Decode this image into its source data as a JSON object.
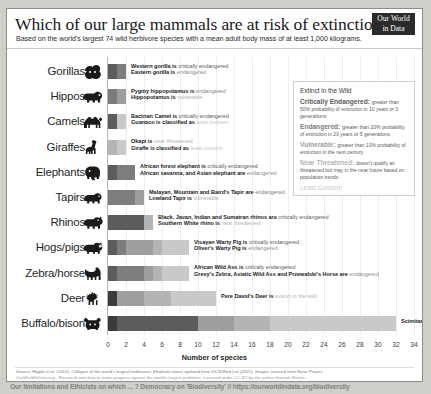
{
  "header": {
    "title": "Which of our large mammals are at risk of extinction?",
    "subtitle": "Based on the world's largest 74 wild herbivore species with a mean adult body mass of at least 1,000 kilograms.",
    "logo_line1": "Our World",
    "logo_line2": "in Data"
  },
  "legend": {
    "title": "IUCN Red List categories",
    "items": [
      {
        "name": "Extinct in the Wild",
        "desc": "",
        "color": "#3b3b3b"
      },
      {
        "name": "Critically Endangered:",
        "desc": "greater than 50% probability of extinction in 10 years or 3 generations",
        "color": "#5c5c5c"
      },
      {
        "name": "Endangered:",
        "desc": "greater than 20% probability of extinction in 20 years or 5 generations",
        "color": "#7d7d7d"
      },
      {
        "name": "Vulnerable:",
        "desc": "greater than 10% probability of extinction in the next century",
        "color": "#9e9e9e"
      },
      {
        "name": "Near Threatened:",
        "desc": "doesn't qualify as threatened but may in the near future based on population trends",
        "color": "#b4b4b4"
      },
      {
        "name": "Least Concern",
        "desc": "",
        "color": "#c9c9c9"
      }
    ]
  },
  "chart_data": {
    "type": "bar",
    "title": "Which of our large mammals are at risk of extinction?",
    "subtitle": "Based on the world's largest 74 wild herbivore species with a mean adult body mass of at least 1,000 kilograms.",
    "xlabel": "Number of species",
    "ylabel": "",
    "xlim": [
      0,
      34
    ],
    "grid": true,
    "legend_position": "top-right",
    "stacked": true,
    "xticks": [
      0,
      2,
      4,
      6,
      8,
      10,
      12,
      14,
      16,
      18,
      20,
      22,
      24,
      26,
      28,
      30,
      32,
      34
    ],
    "series": [
      {
        "name": "Extinct in the Wild",
        "color": "#3b3b3b"
      },
      {
        "name": "Critically Endangered",
        "color": "#5c5c5c"
      },
      {
        "name": "Endangered",
        "color": "#7d7d7d"
      },
      {
        "name": "Vulnerable",
        "color": "#9e9e9e"
      },
      {
        "name": "Near Threatened",
        "color": "#b4b4b4"
      },
      {
        "name": "Least Concern",
        "color": "#c9c9c9"
      }
    ],
    "categories": [
      "Gorillas",
      "Hippos",
      "Camels",
      "Giraffes",
      "Elephants",
      "Tapirs",
      "Rhinos",
      "Hogs/pigs",
      "Zebra/horse",
      "Deer",
      "Buffalo/bison"
    ],
    "rows": [
      {
        "label": "Gorillas",
        "icon": "gorilla-icon",
        "total": 2,
        "segments": [
          {
            "cat": "Critically Endangered",
            "value": 1
          },
          {
            "cat": "Endangered",
            "value": 1
          }
        ],
        "annotations": [
          {
            "species": "Western gorilla is",
            "status": " critically endangered",
            "status_color": "#5c5c5c"
          },
          {
            "species": "Eastern gorilla is",
            "status": " endangered",
            "status_color": "#8c8c8c"
          }
        ]
      },
      {
        "label": "Hippos",
        "icon": "hippo-icon",
        "total": 2,
        "segments": [
          {
            "cat": "Endangered",
            "value": 1
          },
          {
            "cat": "Vulnerable",
            "value": 1
          }
        ],
        "annotations": [
          {
            "species": "Pygmy hippopotamus is",
            "status": " endangered",
            "status_color": "#7d7d7d"
          },
          {
            "species": "Hippopotamus is",
            "status": " vulnerable",
            "status_color": "#b0b0b0"
          }
        ]
      },
      {
        "label": "Camels",
        "icon": "camel-icon",
        "total": 2,
        "segments": [
          {
            "cat": "Critically Endangered",
            "value": 1
          },
          {
            "cat": "Least Concern",
            "value": 1
          }
        ],
        "annotations": [
          {
            "species": "Bactrian Camel is",
            "status": " critically endangered",
            "status_color": "#5c5c5c"
          },
          {
            "species": "Guanaco is classified as",
            "status": " least concern",
            "status_color": "#c2c2c2"
          }
        ]
      },
      {
        "label": "Giraffes",
        "icon": "giraffe-icon",
        "total": 2,
        "segments": [
          {
            "cat": "Near Threatened",
            "value": 1
          },
          {
            "cat": "Least Concern",
            "value": 1
          }
        ],
        "annotations": [
          {
            "species": "Okapi is",
            "status": " near threatened",
            "status_color": "#b4b4b4"
          },
          {
            "species": "Giraffe is classified as",
            "status": " least concern",
            "status_color": "#c6c6c6"
          }
        ]
      },
      {
        "label": "Elephants",
        "icon": "elephant-icon",
        "total": 3,
        "segments": [
          {
            "cat": "Critically Endangered",
            "value": 1
          },
          {
            "cat": "Endangered",
            "value": 2
          }
        ],
        "annotations": [
          {
            "species": "African forest elephant is",
            "status": " critically endangered",
            "status_color": "#5c5c5c"
          },
          {
            "species": "African savanna, and Asian elephant are",
            "status": " endangered",
            "status_color": "#8c8c8c"
          }
        ]
      },
      {
        "label": "Tapirs",
        "icon": "tapir-icon",
        "total": 4,
        "segments": [
          {
            "cat": "Endangered",
            "value": 3
          },
          {
            "cat": "Vulnerable",
            "value": 1
          }
        ],
        "annotations": [
          {
            "species": "Malayan, Mountain and Baird's Tapir are",
            "status": " endangered",
            "status_color": "#7d7d7d"
          },
          {
            "species": "Lowland Tapir is",
            "status": " vulnerable",
            "status_color": "#b0b0b0"
          }
        ]
      },
      {
        "label": "Rhinos",
        "icon": "rhino-icon",
        "total": 5,
        "segments": [
          {
            "cat": "Critically Endangered",
            "value": 4
          },
          {
            "cat": "Near Threatened",
            "value": 1
          }
        ],
        "annotations": [
          {
            "species": "Black, Javan, Indian and Sumatran rhinos are",
            "status": " critically endangered",
            "status_color": "#5c5c5c"
          },
          {
            "species": "Southern White rhino is",
            "status": " near threatened",
            "status_color": "#b4b4b4"
          }
        ]
      },
      {
        "label": "Hogs/pigs",
        "icon": "pig-icon",
        "total": 9,
        "segments": [
          {
            "cat": "Critically Endangered",
            "value": 1
          },
          {
            "cat": "Endangered",
            "value": 1
          },
          {
            "cat": "Vulnerable",
            "value": 3
          },
          {
            "cat": "Near Threatened",
            "value": 1
          },
          {
            "cat": "Least Concern",
            "value": 3
          }
        ],
        "annotations": [
          {
            "species": "Visayan Warty Pig is",
            "status": " critically endangered",
            "status_color": "#5c5c5c"
          },
          {
            "species": "Oliver's Warty Pig is",
            "status": " endangered",
            "status_color": "#8c8c8c"
          }
        ]
      },
      {
        "label": "Zebra/horse",
        "icon": "zebra-icon",
        "total": 9,
        "segments": [
          {
            "cat": "Critically Endangered",
            "value": 1
          },
          {
            "cat": "Endangered",
            "value": 3
          },
          {
            "cat": "Vulnerable",
            "value": 1
          },
          {
            "cat": "Near Threatened",
            "value": 1
          },
          {
            "cat": "Least Concern",
            "value": 3
          }
        ],
        "annotations": [
          {
            "species": "African Wild Ass is",
            "status": " critically endangered",
            "status_color": "#5c5c5c"
          },
          {
            "species": "Grevy's Zebra, Asiatic Wild Ass and Przewalski's Horse are",
            "status": " endangered",
            "status_color": "#8c8c8c"
          }
        ]
      },
      {
        "label": "Deer",
        "icon": "deer-icon",
        "total": 12,
        "segments": [
          {
            "cat": "Extinct in the Wild",
            "value": 1
          },
          {
            "cat": "Vulnerable",
            "value": 3
          },
          {
            "cat": "Near Threatened",
            "value": 3
          },
          {
            "cat": "Least Concern",
            "value": 5
          }
        ],
        "annotations": [
          {
            "species": "Pere David's Deer is",
            "status": " extinct in the wild",
            "status_color": "#b4b4b4"
          }
        ]
      },
      {
        "label": "Buffalo/bison",
        "icon": "buffalo-icon",
        "total": 32,
        "segments": [
          {
            "cat": "Extinct in the Wild",
            "value": 1
          },
          {
            "cat": "Critically Endangered",
            "value": 9
          },
          {
            "cat": "Vulnerable",
            "value": 4
          },
          {
            "cat": "Near Threatened",
            "value": 4
          },
          {
            "cat": "Least Concern",
            "value": 14
          }
        ],
        "annotations": [
          {
            "species": "Scimitar-horned Oryx is",
            "status": " extinct in the wild",
            "status_color": "#b4b4b4"
          }
        ]
      }
    ]
  },
  "footer": {
    "source": "Source: Ripple et al. (2015). Collapse of the world's largest herbivores. Elephant status updated from IUCN Red List (2021). Images sourced from Noun Project.",
    "license_line": "OurWorldInData.org - Research and data to make progress against the world's largest problems.",
    "license": "Licensed under CC-BY by the author Hannah Ritchie.",
    "outside": "Our limitations and Ethicists on which ... ? Democracy on 'Biodiversity'  //  https://ourworldindata.org/biodiversity"
  }
}
